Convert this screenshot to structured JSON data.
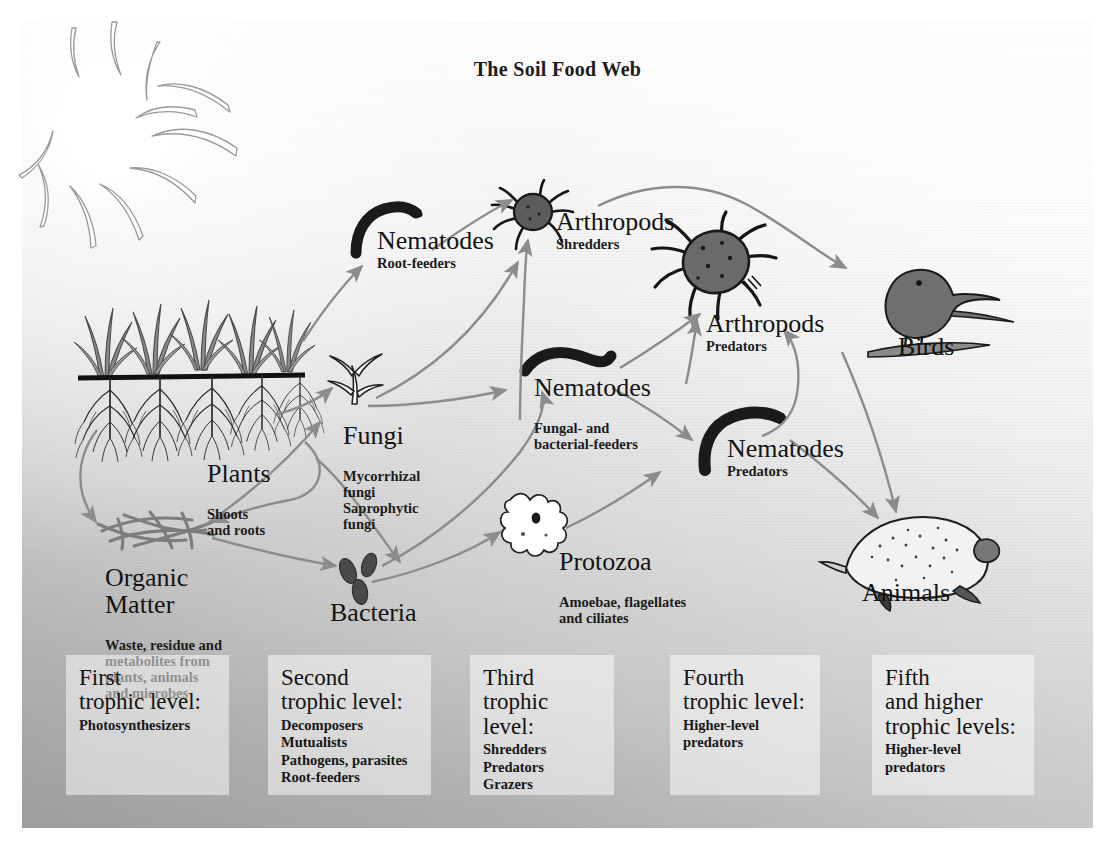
{
  "title": "The Soil Food Web",
  "palette": {
    "ink": "#161616",
    "arrow": "#8c8c8c",
    "organism_dark": "#3b3b3b",
    "grass": "#7a7a7a",
    "panel_light": "#fdfdfd",
    "panel_dark": "#a6a6a6",
    "box_fill": "#ffffff"
  },
  "nodes": {
    "sun": {
      "name": "sun"
    },
    "plants": {
      "title": "Plants",
      "sub": "Shoots\nand roots"
    },
    "organic_matter": {
      "title": "Organic\nMatter",
      "sub": "Waste, residue and\nmetabolites from\nplants, animals\nand microbes"
    },
    "fungi": {
      "title": "Fungi",
      "sub": "Mycorrhizal\nfungi\nSaprophytic\nfungi"
    },
    "bacteria": {
      "title": "Bacteria",
      "sub": ""
    },
    "nematodes_root": {
      "title": "Nematodes",
      "sub": "Root-feeders"
    },
    "nematodes_fungal": {
      "title": "Nematodes",
      "sub": "Fungal- and\nbacterial-feeders"
    },
    "nematodes_predators": {
      "title": "Nematodes",
      "sub": "Predators"
    },
    "protozoa": {
      "title": "Protozoa",
      "sub": "Amoebae, flagellates\nand ciliates"
    },
    "arthropods_shredders": {
      "title": "Arthropods",
      "sub": "Shredders"
    },
    "arthropods_predators": {
      "title": "Arthropods",
      "sub": "Predators"
    },
    "birds": {
      "title": "Birds",
      "sub": ""
    },
    "animals": {
      "title": "Animals",
      "sub": ""
    }
  },
  "trophic_levels": [
    {
      "title": "First\ntrophic level:",
      "items": [
        "Photosynthesizers"
      ]
    },
    {
      "title": "Second\ntrophic level:",
      "items": [
        "Decomposers",
        "Mutualists",
        "Pathogens, parasites",
        "Root-feeders"
      ]
    },
    {
      "title": "Third\ntrophic level:",
      "items": [
        "Shredders",
        "Predators",
        "Grazers"
      ]
    },
    {
      "title": "Fourth\ntrophic level:",
      "items": [
        "Higher-level",
        "predators"
      ]
    },
    {
      "title": "Fifth\nand higher\ntrophic levels:",
      "items": [
        "Higher-level",
        "predators"
      ]
    }
  ]
}
